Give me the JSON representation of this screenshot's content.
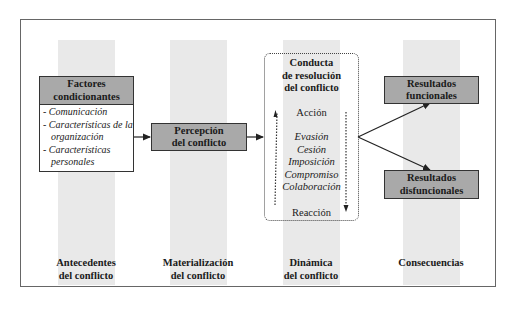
{
  "stages": [
    {
      "label_line1": "Antecedentes",
      "label_line2": "del conflicto"
    },
    {
      "label_line1": "Materialización",
      "label_line2": "del conflicto"
    },
    {
      "label_line1": "Dinámica",
      "label_line2": "del conflicto"
    },
    {
      "label_line1": "Consecuencias",
      "label_line2": ""
    }
  ],
  "factors": {
    "title_line1": "Factores",
    "title_line2": "condicionantes",
    "items": [
      "- Comunicación",
      "- Características de la organización",
      "- Características personales"
    ]
  },
  "perception": {
    "line1": "Percepción",
    "line2": "del conflicto"
  },
  "conduct": {
    "title_line1": "Conducta",
    "title_line2": "de resolución",
    "title_line3": "del conflicto",
    "top_label": "Acción",
    "styles": [
      "Evasión",
      "Cesión",
      "Imposición",
      "Compromiso",
      "Colaboración"
    ],
    "bottom_label": "Reacción"
  },
  "results": {
    "functional": {
      "line1": "Resultados",
      "line2": "funcionales"
    },
    "dysfunctional": {
      "line1": "Resultados",
      "line2": "disfuncionales"
    }
  },
  "colors": {
    "box_fill": "#a9a9a9",
    "column_fill": "#e9e9e9",
    "border": "#333333"
  }
}
